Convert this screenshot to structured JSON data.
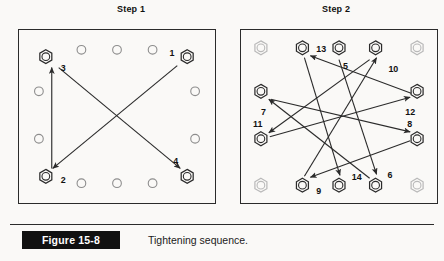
{
  "figure": {
    "badge": "Figure 15-8",
    "caption": "Tightening sequence.",
    "colors": {
      "ink": "#2b2b2b",
      "label": "#111111",
      "faded_bolt": "#b9b9b9",
      "page_background": "#faf9f7",
      "badge_background": "#111111",
      "badge_text": "#ffffff"
    }
  },
  "panels": [
    {
      "id": "step1",
      "title": "Step 1",
      "flange": {
        "shape": "square",
        "hole_count": 12,
        "corner_fasteners": "hex-nut",
        "edge_fasteners": "plain-hole"
      },
      "bolts": [
        {
          "n": "1",
          "pos": "top-right",
          "x": 170,
          "y": 27,
          "label_x": 152,
          "label_y": 26,
          "type": "hex"
        },
        {
          "n": "2",
          "pos": "bottom-left",
          "x": 27,
          "y": 148,
          "label_x": 42,
          "label_y": 155,
          "type": "hex"
        },
        {
          "n": "3",
          "pos": "top-left",
          "x": 27,
          "y": 27,
          "label_x": 42,
          "label_y": 41,
          "type": "hex"
        },
        {
          "n": "4",
          "pos": "bottom-right",
          "x": 170,
          "y": 148,
          "label_x": 156,
          "label_y": 136,
          "type": "hex"
        }
      ],
      "plain_holes": [
        {
          "x": 63,
          "y": 20
        },
        {
          "x": 99,
          "y": 20
        },
        {
          "x": 135,
          "y": 20
        },
        {
          "x": 63,
          "y": 155
        },
        {
          "x": 99,
          "y": 155
        },
        {
          "x": 135,
          "y": 155
        },
        {
          "x": 20,
          "y": 62
        },
        {
          "x": 20,
          "y": 110
        },
        {
          "x": 178,
          "y": 62
        },
        {
          "x": 178,
          "y": 110
        }
      ],
      "arrows": [
        {
          "from": "1",
          "to": "2",
          "x1": 160,
          "y1": 36,
          "x2": 34,
          "y2": 140
        },
        {
          "from": "2",
          "to": "3",
          "x1": 33,
          "y1": 140,
          "x2": 33,
          "y2": 38
        },
        {
          "from": "3",
          "to": "4",
          "x1": 40,
          "y1": 38,
          "x2": 163,
          "y2": 140
        }
      ],
      "sequence": [
        "1",
        "2",
        "3",
        "4"
      ]
    },
    {
      "id": "step2",
      "title": "Step 2",
      "flange": {
        "shape": "square",
        "hole_count": 12,
        "corner_fasteners": "hex-nut-faded",
        "edge_fasteners": "hex-nut"
      },
      "bolts": [
        {
          "n": "13",
          "x": 62,
          "y": 18,
          "label_x": 76,
          "label_y": 22,
          "type": "hex"
        },
        {
          "n": "5",
          "x": 99,
          "y": 18,
          "label_x": 103,
          "label_y": 39,
          "type": "hex"
        },
        {
          "n": "10",
          "x": 136,
          "y": 18,
          "label_x": 149,
          "label_y": 42,
          "type": "hex"
        },
        {
          "n": "7",
          "x": 20,
          "y": 62,
          "label_x": 20,
          "label_y": 86,
          "type": "hex"
        },
        {
          "n": "11",
          "x": 20,
          "y": 110,
          "label_x": 12,
          "label_y": 98,
          "type": "hex"
        },
        {
          "n": "12",
          "x": 178,
          "y": 62,
          "label_x": 166,
          "label_y": 86,
          "type": "hex"
        },
        {
          "n": "8",
          "x": 178,
          "y": 110,
          "label_x": 168,
          "label_y": 98,
          "type": "hex"
        },
        {
          "n": "9",
          "x": 62,
          "y": 157,
          "label_x": 76,
          "label_y": 166,
          "type": "hex"
        },
        {
          "n": "14",
          "x": 99,
          "y": 157,
          "label_x": 112,
          "label_y": 152,
          "type": "hex"
        },
        {
          "n": "6",
          "x": 136,
          "y": 157,
          "label_x": 148,
          "label_y": 150,
          "type": "hex"
        }
      ],
      "faded_bolts": [
        {
          "x": 20,
          "y": 18
        },
        {
          "x": 178,
          "y": 18
        },
        {
          "x": 20,
          "y": 157
        },
        {
          "x": 178,
          "y": 157
        }
      ],
      "arrows": [
        {
          "from": "5",
          "to": "6",
          "x1": 99,
          "y1": 30,
          "x2": 137,
          "y2": 146
        },
        {
          "from": "6",
          "to": "7",
          "x1": 130,
          "y1": 150,
          "x2": 28,
          "y2": 70
        },
        {
          "from": "7",
          "to": "8",
          "x1": 30,
          "y1": 70,
          "x2": 171,
          "y2": 103
        },
        {
          "from": "8",
          "to": "9",
          "x1": 171,
          "y1": 112,
          "x2": 70,
          "y2": 149
        },
        {
          "from": "9",
          "to": "10",
          "x1": 64,
          "y1": 148,
          "x2": 137,
          "y2": 28
        },
        {
          "from": "10",
          "to": "11",
          "x1": 130,
          "y1": 30,
          "x2": 28,
          "y2": 104
        },
        {
          "from": "11",
          "to": "12",
          "x1": 29,
          "y1": 108,
          "x2": 171,
          "y2": 68
        },
        {
          "from": "12",
          "to": "13",
          "x1": 172,
          "y1": 64,
          "x2": 70,
          "y2": 26
        },
        {
          "from": "13",
          "to": "14",
          "x1": 64,
          "y1": 28,
          "x2": 100,
          "y2": 147
        }
      ],
      "sequence": [
        "5",
        "6",
        "7",
        "8",
        "9",
        "10",
        "11",
        "12",
        "13",
        "14"
      ]
    }
  ]
}
